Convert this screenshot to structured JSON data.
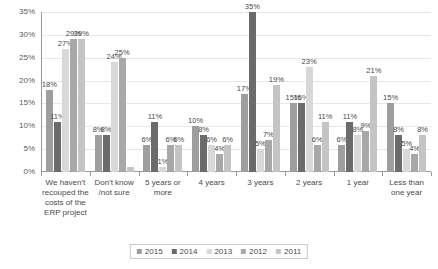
{
  "chart_data": {
    "type": "bar",
    "title": "",
    "xlabel": "",
    "ylabel": "",
    "ylim": [
      0,
      35
    ],
    "grid": true,
    "legend_position": "bottom",
    "y_ticks": [
      "0%",
      "5%",
      "10%",
      "15%",
      "20%",
      "25%",
      "30%",
      "35%"
    ],
    "y_tick_values": [
      0,
      5,
      10,
      15,
      20,
      25,
      30,
      35
    ],
    "categories": [
      "We haven't recouped the costs of the ERP project",
      "Don't know /not sure",
      "5 years or more",
      "4 years",
      "3 years",
      "2 years",
      "1 year",
      "Less than one year"
    ],
    "series": [
      {
        "name": "2015",
        "color": "#9e9e9e",
        "values": [
          18,
          8,
          6,
          10,
          17,
          15,
          6,
          15
        ],
        "labels": [
          "18%",
          "8%",
          "6%",
          "10%",
          "17%",
          "15%",
          "6%",
          "15%"
        ]
      },
      {
        "name": "2014",
        "color": "#6b6b6b",
        "values": [
          11,
          8,
          11,
          8,
          35,
          15,
          11,
          8
        ],
        "labels": [
          "11%",
          "8%",
          "11%",
          "8%",
          "35%",
          "15%",
          "11%",
          "8%"
        ]
      },
      {
        "name": "2013",
        "color": "#d8d8d8",
        "values": [
          27,
          24,
          1,
          6,
          5,
          23,
          8,
          5
        ],
        "labels": [
          "27%",
          "24%",
          "1%",
          "6%",
          "5%",
          "23%",
          "8%",
          "5%"
        ]
      },
      {
        "name": "2012",
        "color": "#a8a8a8",
        "values": [
          29,
          25,
          6,
          4,
          7,
          6,
          9,
          4
        ],
        "labels": [
          "29%",
          "25%",
          "6%",
          "4%",
          "7%",
          "6%",
          "9%",
          "4%"
        ]
      },
      {
        "name": "2011",
        "color": "#c4c4c4",
        "values": [
          29,
          1,
          6,
          6,
          19,
          11,
          21,
          8
        ],
        "labels": [
          "29%",
          "",
          "6%",
          "6%",
          "19%",
          "11%",
          "21%",
          "8%"
        ]
      }
    ]
  }
}
